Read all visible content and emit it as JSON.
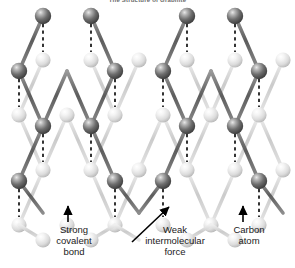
{
  "title": "The Structure of Graphite",
  "labels": {
    "strong_bond": {
      "line1": "Strong",
      "line2": "covalent",
      "line3": "bond"
    },
    "weak_force": {
      "line1": "Weak",
      "line2": "intermolecular",
      "line3": "force"
    },
    "carbon_atom": {
      "line1": "Carbon",
      "line2": "atom"
    }
  },
  "colors": {
    "background": "#ffffff",
    "front_layer_atom": "#545454",
    "front_layer_atom_highlight": "#d8d8d8",
    "back_layer_atom": "#e2e2e2",
    "back_layer_atom_highlight": "#ffffff",
    "front_bond": "#6b6b6b",
    "back_bond": "#cfcfcf",
    "dashed_force_line": "#111111",
    "arrow": "#000000",
    "label_text": "#1a1a1a",
    "title_text": "#6a6a6a"
  },
  "diagram": {
    "kind": "graphite-crystal-lattice",
    "layers": 2,
    "front_layer_name": "upper carbon sheet",
    "back_layer_name": "lower carbon sheet",
    "bond_type_in_layer": "strong covalent bond",
    "bond_type_between_layers": "weak intermolecular force",
    "atom_element": "Carbon"
  }
}
